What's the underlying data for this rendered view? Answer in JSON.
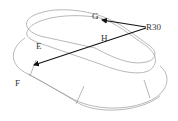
{
  "diagram": {
    "labels": {
      "G": "G",
      "H": "H",
      "E": "E",
      "F": "F",
      "radius": "R30"
    },
    "colors": {
      "background": "#ffffff",
      "edges": "#9a9a9a",
      "arrows": "#111111",
      "text": "#333333"
    }
  }
}
